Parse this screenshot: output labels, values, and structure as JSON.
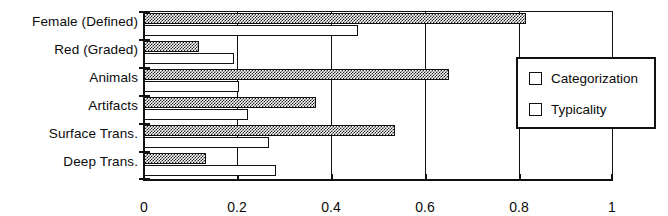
{
  "chart_data": {
    "type": "bar",
    "orientation": "horizontal",
    "title": "",
    "subtitle": "",
    "xlabel": "",
    "ylabel": "",
    "xlim": [
      0,
      1
    ],
    "xticks": [
      0,
      0.2,
      0.4,
      0.6,
      0.8,
      1
    ],
    "xtick_labels": [
      "0",
      "0.2",
      "0.4",
      "0.6",
      "0.8",
      "1"
    ],
    "grid": "vertical",
    "legend_position": "right-inside",
    "categories": [
      "Female  (Defined)",
      "Red (Graded)",
      "Animals",
      "Artifacts",
      "Surface Trans.",
      "Deep Trans."
    ],
    "series": [
      {
        "name": "Categorization",
        "fill": "dark-checker",
        "color": "#1c1c1c",
        "values": [
          0.815,
          0.115,
          0.65,
          0.365,
          0.535,
          0.13
        ]
      },
      {
        "name": "Typicality",
        "fill": "light-dots",
        "color": "#d8d8d8",
        "values": [
          0.455,
          0.19,
          0.2,
          0.22,
          0.265,
          0.28
        ]
      }
    ]
  },
  "legend": {
    "items": [
      {
        "label": "Categorization",
        "swatch": "dark-checker-swatch"
      },
      {
        "label": "Typicality",
        "swatch": "light-dots-swatch"
      }
    ]
  },
  "axis": {
    "x_tick_labels": [
      "0",
      "0.2",
      "0.4",
      "0.6",
      "0.8",
      "1"
    ]
  }
}
